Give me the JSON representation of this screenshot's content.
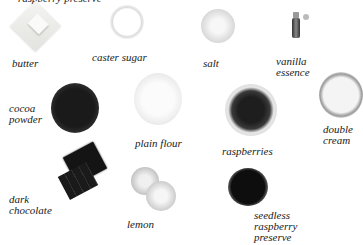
{
  "top_cutoff_text": "raspberry preserve",
  "ingredients": [
    {
      "id": "butter",
      "label": "butter"
    },
    {
      "id": "caster-sugar",
      "label": "caster sugar"
    },
    {
      "id": "salt",
      "label": "salt"
    },
    {
      "id": "vanilla-essence",
      "label": "vanilla\nessence"
    },
    {
      "id": "cocoa-powder",
      "label": "cocoa\npowder"
    },
    {
      "id": "plain-flour",
      "label": "plain flour"
    },
    {
      "id": "raspberries",
      "label": "raspberries"
    },
    {
      "id": "double-cream",
      "label": "double\ncream"
    },
    {
      "id": "dark-chocolate",
      "label": "dark\nchocolate"
    },
    {
      "id": "lemon",
      "label": "lemon"
    },
    {
      "id": "seedless-raspberry-preserve",
      "label": "seedless\nraspberry\npreserve"
    }
  ]
}
